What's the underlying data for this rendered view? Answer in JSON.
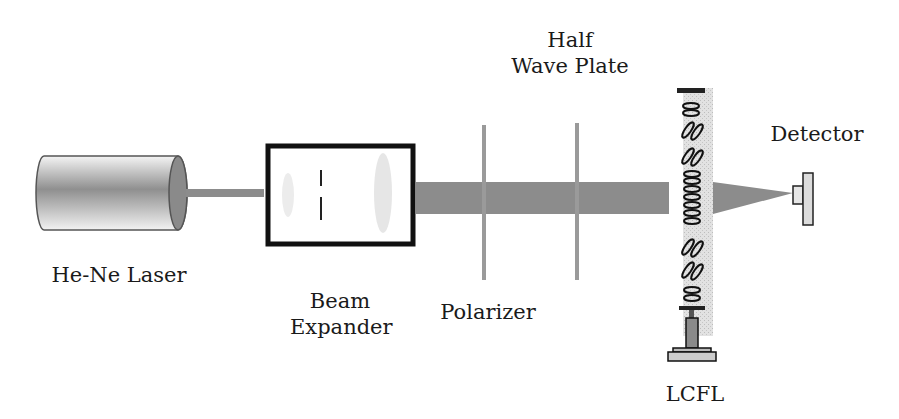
{
  "diagram": {
    "type": "optical-setup",
    "components": [
      {
        "id": "laser",
        "label": "He-Ne Laser"
      },
      {
        "id": "beam_expander",
        "label_line1": "Beam",
        "label_line2": "Expander"
      },
      {
        "id": "polarizer",
        "label": "Polarizer"
      },
      {
        "id": "half_wave_plate",
        "label_line1": "Half",
        "label_line2": "Wave Plate"
      },
      {
        "id": "lcfl",
        "label": "LCFL"
      },
      {
        "id": "detector",
        "label": "Detector"
      }
    ],
    "colors": {
      "beam": "#8c8c8c",
      "outline": "#111111",
      "plate": "#9a9a9a",
      "cell_fill": "#dcdcdc"
    }
  }
}
